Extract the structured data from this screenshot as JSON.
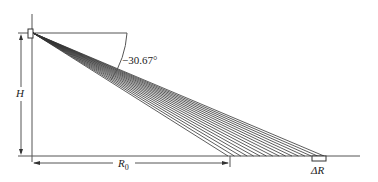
{
  "diagram": {
    "angle_label": "−30.67°",
    "height_label": "H",
    "range_label": "R",
    "range_subscript": "0",
    "delta_label": "ΔR",
    "rays": {
      "count": 16,
      "origin": [
        33,
        33
      ],
      "end_start_x": 228,
      "end_stop_x": 324,
      "ground_y": 156
    },
    "colors": {
      "line": "#333333",
      "background": "#ffffff"
    }
  }
}
